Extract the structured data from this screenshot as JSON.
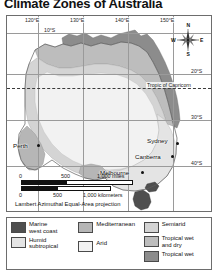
{
  "title": "Climate Zones of Australia",
  "map": {
    "projection_note": "Lambert Azimuthal Equal-Area projection",
    "tropic_label": "Tropic of Capricorn",
    "longitude_labels": [
      "120°E",
      "130°E",
      "140°E",
      "150°E"
    ],
    "latitude_labels": [
      "10°S",
      "20°S",
      "30°S",
      "40°S"
    ],
    "cities": [
      {
        "name": "Perth",
        "label_side": "left"
      },
      {
        "name": "Sydney",
        "label_side": "left"
      },
      {
        "name": "Canberra",
        "label_side": "left"
      },
      {
        "name": "Melbourne",
        "label_side": "left"
      }
    ],
    "compass": {
      "north": "N",
      "south": "S",
      "east": "E",
      "west": "W"
    }
  },
  "scale": {
    "miles_unit": "1,000 miles",
    "miles_ticks": [
      "0",
      "500",
      "1,000 miles"
    ],
    "km_ticks": [
      "0",
      "500",
      "1,000 kilometers"
    ],
    "km_unit": "1,000 kilometers"
  },
  "legend": {
    "column1": [
      {
        "label": "Marine\nwest coast",
        "line1": "Marine",
        "line2": "west coast",
        "color": "#4f4f4f"
      },
      {
        "label": "Humid\nsubtropical",
        "line1": "Humid",
        "line2": "subtropical",
        "color": "#e4e4e4"
      }
    ],
    "column2": [
      {
        "label": "Mediterranean",
        "line1": "Mediterranean",
        "line2": "",
        "color": "#b6b6b6"
      },
      {
        "label": "Arid",
        "line1": "Arid",
        "line2": "",
        "color": "#f2f2f2"
      }
    ],
    "column3": [
      {
        "label": "Semiarid",
        "line1": "Semiarid",
        "line2": "",
        "color": "#d4d4d4"
      },
      {
        "label": "Tropical wet\nand dry",
        "line1": "Tropical wet",
        "line2": "and dry",
        "color": "#bdbdbd"
      },
      {
        "label": "Tropical wet",
        "line1": "Tropical wet",
        "line2": "",
        "color": "#8c8c8c"
      }
    ]
  },
  "colors": {
    "marine_west_coast": "#4f4f4f",
    "humid_subtropical": "#e4e4e4",
    "mediterranean": "#b6b6b6",
    "arid": "#f2f2f2",
    "semiarid": "#d4d4d4",
    "tropical_wet_and_dry": "#bdbdbd",
    "tropical_wet": "#8c8c8c",
    "frame": "#6d6d6d",
    "graticule": "#9a9a9a"
  }
}
